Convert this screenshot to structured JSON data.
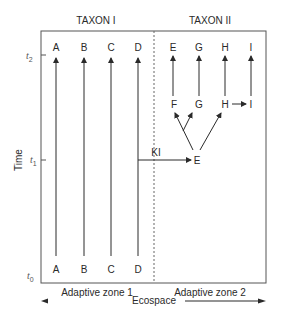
{
  "diagram": {
    "headers": {
      "taxon1": "TAXON I",
      "taxon2": "TAXON II"
    },
    "axis": {
      "y_label": "Time",
      "ticks": [
        {
          "base": "t",
          "sub": "2"
        },
        {
          "base": "t",
          "sub": "1"
        },
        {
          "base": "t",
          "sub": "0"
        }
      ]
    },
    "taxon1": {
      "top_labels": [
        "A",
        "B",
        "C",
        "D"
      ],
      "bottom_labels": [
        "A",
        "B",
        "C",
        "D"
      ]
    },
    "taxon2": {
      "top_labels": [
        "E",
        "G",
        "H",
        "I"
      ],
      "mid_labels": [
        "F",
        "G",
        "H",
        "I"
      ],
      "origin_label": "E"
    },
    "transition_label": "KI",
    "zones": {
      "zone1": "Adaptive zone 1",
      "zone2": "Adaptive zone 2"
    },
    "x_axis_label": "Ecospace",
    "colors": {
      "line": "#2a2a2a",
      "ecospace_left": "#2a2a2a",
      "ecospace_right": "#8fcf8f"
    }
  }
}
